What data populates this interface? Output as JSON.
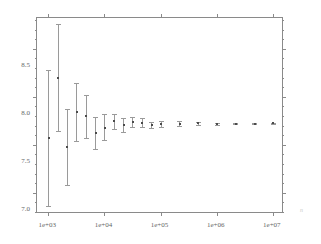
{
  "chart_data": {
    "type": "scatter",
    "title": "",
    "subtitle": "",
    "xlabel": "n",
    "ylabel": "",
    "xscale": "log",
    "yscale": "linear",
    "xlim": [
      630,
      15800000
    ],
    "ylim": [
      6.78,
      8.82
    ],
    "grid": false,
    "legend": null,
    "xticks": [
      1000,
      10000,
      100000,
      1000000,
      10000000
    ],
    "xticklabels": [
      "1e+03",
      "1e+04",
      "1e+05",
      "1e+06",
      "1e+07"
    ],
    "yticks": [
      7.0,
      7.5,
      8.0,
      8.5
    ],
    "yticklabels": [
      "7.0",
      "7.5",
      "8.0",
      "8.5"
    ],
    "yminorticks": [
      6.8,
      6.9,
      7.1,
      7.2,
      7.3,
      7.4,
      7.6,
      7.7,
      7.8,
      7.9,
      8.1,
      8.2,
      8.3,
      8.4,
      8.6,
      8.7,
      8.8
    ],
    "error_bars": true,
    "series": [
      {
        "name": "estimate",
        "marker": "point",
        "points": [
          {
            "x": 1000,
            "y": 7.57,
            "ylow": 6.86,
            "yhigh": 8.28
          },
          {
            "x": 1480,
            "y": 8.2,
            "ylow": 7.64,
            "yhigh": 8.76
          },
          {
            "x": 2150,
            "y": 7.48,
            "ylow": 7.08,
            "yhigh": 7.87
          },
          {
            "x": 3160,
            "y": 7.84,
            "ylow": 7.54,
            "yhigh": 8.14
          },
          {
            "x": 4640,
            "y": 7.8,
            "ylow": 7.57,
            "yhigh": 8.02
          },
          {
            "x": 6810,
            "y": 7.62,
            "ylow": 7.46,
            "yhigh": 7.79
          },
          {
            "x": 10000,
            "y": 7.68,
            "ylow": 7.55,
            "yhigh": 7.82
          },
          {
            "x": 14800,
            "y": 7.745,
            "ylow": 7.665,
            "yhigh": 7.825
          },
          {
            "x": 21500,
            "y": 7.705,
            "ylow": 7.635,
            "yhigh": 7.775
          },
          {
            "x": 31600,
            "y": 7.735,
            "ylow": 7.685,
            "yhigh": 7.785
          },
          {
            "x": 46400,
            "y": 7.73,
            "ylow": 7.685,
            "yhigh": 7.775
          },
          {
            "x": 68100,
            "y": 7.705,
            "ylow": 7.67,
            "yhigh": 7.74
          },
          {
            "x": 100000,
            "y": 7.72,
            "ylow": 7.69,
            "yhigh": 7.75
          },
          {
            "x": 215000,
            "y": 7.72,
            "ylow": 7.697,
            "yhigh": 7.743
          },
          {
            "x": 464000,
            "y": 7.722,
            "ylow": 7.705,
            "yhigh": 7.739
          },
          {
            "x": 1000000,
            "y": 7.72,
            "ylow": 7.708,
            "yhigh": 7.732
          },
          {
            "x": 2150000,
            "y": 7.721,
            "ylow": 7.712,
            "yhigh": 7.73
          },
          {
            "x": 4640000,
            "y": 7.721,
            "ylow": 7.714,
            "yhigh": 7.728
          },
          {
            "x": 10000000,
            "y": 7.722,
            "ylow": 7.717,
            "yhigh": 7.727
          }
        ]
      }
    ]
  },
  "colors": {
    "axis": "#8a8a8a",
    "errorbar": "#9a9a9a",
    "point": "#4a4a4a",
    "label": "#666666",
    "xtitle": "#c9c9c9",
    "background": "#ffffff"
  }
}
